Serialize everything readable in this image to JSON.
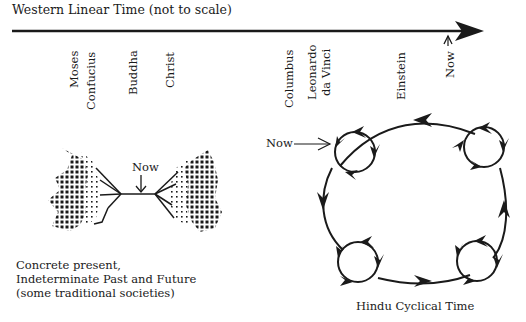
{
  "diagram": {
    "linear": {
      "title": "Western Linear Time (not to scale)",
      "events": [
        {
          "label": "Moses",
          "x": 74
        },
        {
          "label": "Confucius",
          "x": 91
        },
        {
          "label": "Buddha",
          "x": 133
        },
        {
          "label": "Christ",
          "x": 171
        },
        {
          "label": "Columbus",
          "x": 289
        },
        {
          "label": "Leonardo",
          "x": 313
        },
        {
          "label": "da Vinci",
          "x": 327
        },
        {
          "label": "Einstein",
          "x": 402
        },
        {
          "label": "Now",
          "x": 451
        }
      ]
    },
    "traditional": {
      "now_label": "Now",
      "caption_line1": "Concrete present,",
      "caption_line2": "Indeterminate Past and Future",
      "caption_line3": "(some traditional societies)"
    },
    "hindu": {
      "now_label": "Now",
      "caption": "Hindu Cyclical Time"
    },
    "colors": {
      "ink": "#1a1a1a",
      "background": "#ffffff"
    }
  }
}
